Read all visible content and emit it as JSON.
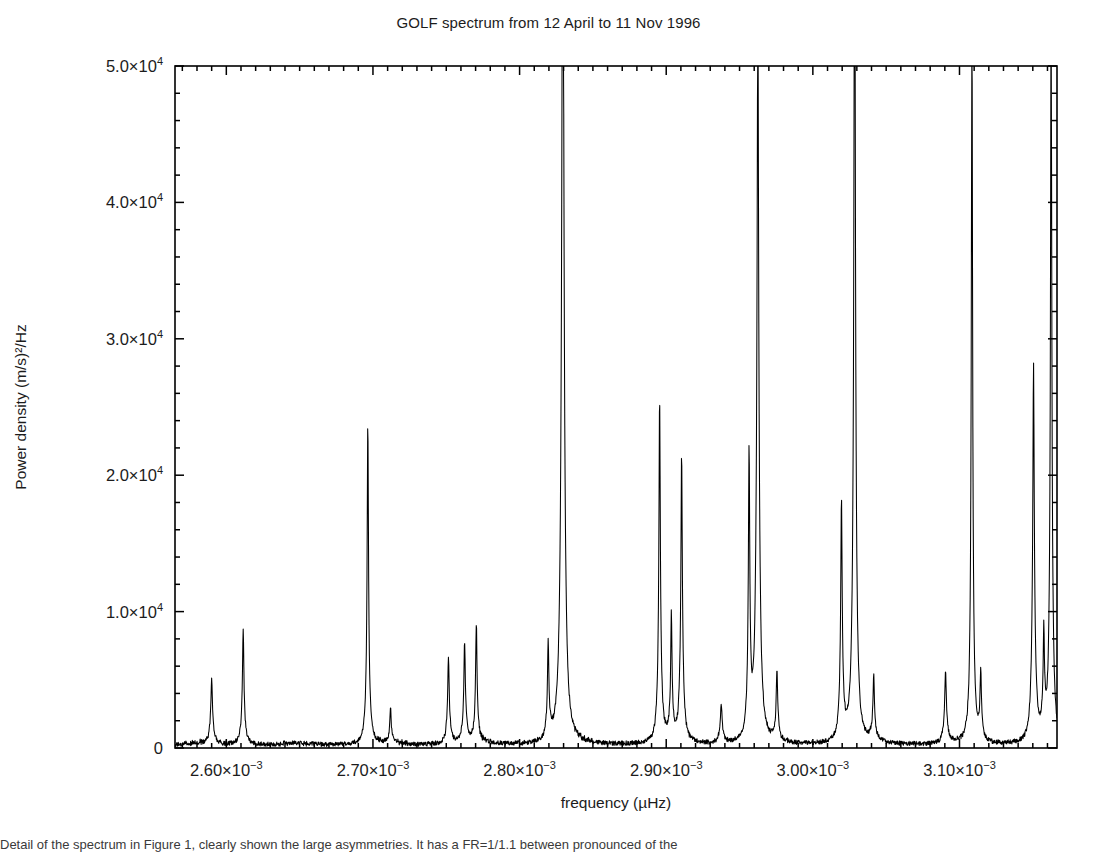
{
  "figure": {
    "title": "GOLF spectrum from 12 April to 11 Nov 1996",
    "caption_fragment": "Detail of the spectrum in Figure 1, clearly shown the large asymmetries. It has a FR=1/1.1 between pronounced of the"
  },
  "chart_data": {
    "type": "line",
    "title": "GOLF spectrum from 12 April to 11 Nov 1996",
    "xlabel": "frequency (µHz)",
    "ylabel": "Power density (m/s)²/Hz",
    "xlim": [
      0.002565,
      0.0031665
    ],
    "ylim": [
      0,
      50000
    ],
    "grid": false,
    "legend": "none",
    "x_tick_values": [
      0.0026,
      0.0027,
      0.0028,
      0.0029,
      0.003,
      0.0031
    ],
    "x_tick_labels": [
      "2.60×10⁻³",
      "2.70×10⁻³",
      "2.80×10⁻³",
      "2.90×10⁻³",
      "3.00×10⁻³",
      "3.10×10⁻³"
    ],
    "x_minor_tick_count": 10,
    "y_tick_values": [
      0,
      10000,
      20000,
      30000,
      40000,
      50000
    ],
    "y_tick_labels": [
      "0",
      "1.0×10⁴",
      "2.0×10⁴",
      "3.0×10⁴",
      "4.0×10⁴",
      "5.0×10⁴"
    ],
    "y_minor_tick_count": 5,
    "line_color": "#000000",
    "series_name": "power density",
    "peaks": [
      {
        "x": 0.00259,
        "height": 3300,
        "width": 3.5e-06,
        "base": 1500
      },
      {
        "x": 0.0026115,
        "height": 6650,
        "width": 3.5e-06,
        "base": 1900
      },
      {
        "x": 0.0026965,
        "height": 18800,
        "width": 3.2e-06,
        "base": 5000
      },
      {
        "x": 0.002712,
        "height": 2000,
        "width": 3e-06,
        "base": 700
      },
      {
        "x": 0.0027515,
        "height": 4400,
        "width": 3.2e-06,
        "base": 2100
      },
      {
        "x": 0.0027625,
        "height": 4950,
        "width": 3.2e-06,
        "base": 2500
      },
      {
        "x": 0.0027705,
        "height": 6400,
        "width": 3.2e-06,
        "base": 2400
      },
      {
        "x": 0.0028195,
        "height": 5100,
        "width": 3e-06,
        "base": 2100
      },
      {
        "x": 0.0028295,
        "height": 46500,
        "width": 3e-06,
        "base": 35900
      },
      {
        "x": 0.0028955,
        "height": 18600,
        "width": 3.2e-06,
        "base": 6800
      },
      {
        "x": 0.0029035,
        "height": 6800,
        "width": 3e-06,
        "base": 2400
      },
      {
        "x": 0.0029105,
        "height": 15000,
        "width": 3.2e-06,
        "base": 6200
      },
      {
        "x": 0.0029375,
        "height": 2000,
        "width": 3.8e-06,
        "base": 900
      },
      {
        "x": 0.0029565,
        "height": 16100,
        "width": 3.2e-06,
        "base": 4700
      },
      {
        "x": 0.0029625,
        "height": 32500,
        "width": 3e-06,
        "base": 23800
      },
      {
        "x": 0.0029755,
        "height": 3600,
        "width": 3.2e-06,
        "base": 1500
      },
      {
        "x": 0.0030195,
        "height": 12500,
        "width": 3.2e-06,
        "base": 5100
      },
      {
        "x": 0.0030285,
        "height": 47500,
        "width": 3e-06,
        "base": 21300
      },
      {
        "x": 0.0030415,
        "height": 3200,
        "width": 3.2e-06,
        "base": 1500
      },
      {
        "x": 0.0030905,
        "height": 3500,
        "width": 3.5e-06,
        "base": 1800
      },
      {
        "x": 0.0031085,
        "height": 44500,
        "width": 3e-06,
        "base": 9000
      },
      {
        "x": 0.0031145,
        "height": 3300,
        "width": 3e-06,
        "base": 1500
      },
      {
        "x": 0.0031505,
        "height": 16800,
        "width": 3e-06,
        "base": 11100
      },
      {
        "x": 0.0031575,
        "height": 5000,
        "width": 2.8e-06,
        "base": 2400
      },
      {
        "x": 0.0031625,
        "height": 42800,
        "width": 3e-06,
        "base": 11800
      }
    ],
    "noise_floor": 300
  }
}
